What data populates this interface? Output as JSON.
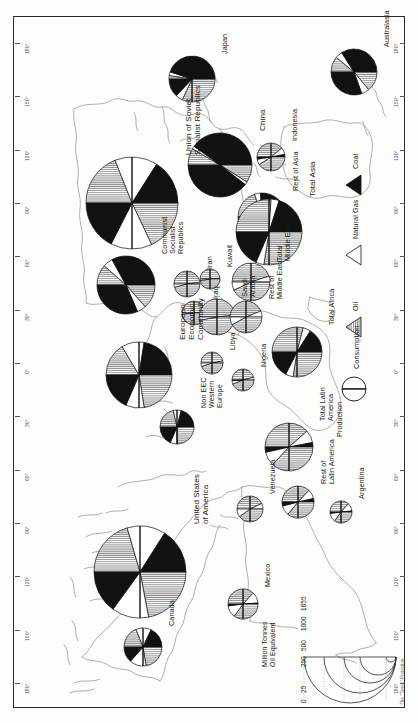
{
  "map": {
    "projection_credit": "The \"Times\" Projection",
    "scale_title": "Million Tonnes\nOil Equivalent",
    "scale_labels": [
      "1655",
      "1000",
      "500",
      "250",
      "25",
      "0"
    ],
    "longitude_ticks_left": [
      "180°",
      "150°",
      "120°",
      "90°",
      "60°",
      "30°",
      "0°",
      "30°",
      "60°",
      "90°",
      "120°",
      "150°",
      "180°"
    ],
    "longitude_ticks_right": [
      "180°",
      "150°",
      "120°",
      "90°",
      "60°",
      "30°",
      "0°",
      "30°",
      "60°",
      "90°",
      "120°",
      "150°",
      "180°"
    ],
    "latitude_ticks": [
      "60°",
      "30°",
      "0°",
      "30°",
      "60°"
    ]
  },
  "legend": {
    "production_label": "Production",
    "consumption_label": "Consumption",
    "fuels": [
      {
        "name": "Oil",
        "color": "#9a9a9a",
        "pattern": "vertical-stripe"
      },
      {
        "name": "Natural Gas",
        "color": "#ffffff",
        "pattern": "solid"
      },
      {
        "name": "Coal",
        "color": "#111111",
        "pattern": "solid"
      }
    ]
  },
  "chart_data": {
    "type": "pie",
    "units": "Million Tonnes Oil Equivalent",
    "series_names": [
      "Oil",
      "Natural Gas",
      "Coal"
    ],
    "colors": [
      "#9a9a9a",
      "#ffffff",
      "#111111"
    ],
    "halves": {
      "top": "Production",
      "bottom": "Consumption"
    },
    "regions": [
      {
        "name": "Union of Soviet\nSocialist Republics",
        "x": 118,
        "y": 186,
        "r": 46,
        "production": {
          "Oil": 38,
          "Natural Gas": 30,
          "Coal": 32
        },
        "consumption": {
          "Oil": 36,
          "Natural Gas": 29,
          "Coal": 35
        }
      },
      {
        "name": "China",
        "x": 206,
        "y": 148,
        "r": 32,
        "production": {
          "Oil": 17,
          "Natural Gas": 3,
          "Coal": 80
        },
        "consumption": {
          "Oil": 18,
          "Natural Gas": 3,
          "Coal": 79
        }
      },
      {
        "name": "Japan",
        "x": 178,
        "y": 62,
        "r": 23,
        "production": {
          "Oil": 5,
          "Natural Gas": 5,
          "Coal": 90
        },
        "consumption": {
          "Oil": 64,
          "Natural Gas": 10,
          "Coal": 26
        }
      },
      {
        "name": "Indonesia",
        "x": 257,
        "y": 140,
        "r": 14,
        "production": {
          "Oil": 78,
          "Natural Gas": 16,
          "Coal": 6
        },
        "consumption": {
          "Oil": 82,
          "Natural Gas": 13,
          "Coal": 5
        }
      },
      {
        "name": "Rest of Asia",
        "x": 248,
        "y": 200,
        "r": 24,
        "production": {
          "Oil": 40,
          "Natural Gas": 8,
          "Coal": 52
        },
        "consumption": {
          "Oil": 46,
          "Natural Gas": 9,
          "Coal": 45
        }
      },
      {
        "name": "Total Asia",
        "x": 255,
        "y": 215,
        "r": 33,
        "production": {
          "Oil": 52,
          "Natural Gas": 8,
          "Coal": 40
        },
        "consumption": {
          "Oil": 55,
          "Natural Gas": 8,
          "Coal": 37
        }
      },
      {
        "name": "Australasia",
        "x": 340,
        "y": 55,
        "r": 23,
        "production": {
          "Oil": 22,
          "Natural Gas": 10,
          "Coal": 68
        },
        "consumption": {
          "Oil": 28,
          "Natural Gas": 11,
          "Coal": 61
        }
      },
      {
        "name": "Communist\nSocialist\nRepublics",
        "x": 112,
        "y": 268,
        "r": 29,
        "production": {
          "Oil": 23,
          "Natural Gas": 11,
          "Coal": 66
        },
        "consumption": {
          "Oil": 27,
          "Natural Gas": 10,
          "Coal": 63
        }
      },
      {
        "name": "Iran",
        "x": 173,
        "y": 267,
        "r": 13,
        "production": {
          "Oil": 96,
          "Natural Gas": 4,
          "Coal": 0
        },
        "consumption": {
          "Oil": 92,
          "Natural Gas": 8,
          "Coal": 0
        }
      },
      {
        "name": "Kuwait",
        "x": 196,
        "y": 262,
        "r": 10,
        "production": {
          "Oil": 98,
          "Natural Gas": 2,
          "Coal": 0
        },
        "consumption": {
          "Oil": 95,
          "Natural Gas": 5,
          "Coal": 0
        }
      },
      {
        "name": "Iraq",
        "x": 180,
        "y": 296,
        "r": 12,
        "production": {
          "Oil": 99,
          "Natural Gas": 1,
          "Coal": 0
        },
        "consumption": {
          "Oil": 97,
          "Natural Gas": 3,
          "Coal": 0
        }
      },
      {
        "name": "Saudi\nArabia",
        "x": 203,
        "y": 300,
        "r": 18,
        "production": {
          "Oil": 97,
          "Natural Gas": 3,
          "Coal": 0
        },
        "consumption": {
          "Oil": 94,
          "Natural Gas": 6,
          "Coal": 0
        }
      },
      {
        "name": "Rest of\nMiddle East",
        "x": 232,
        "y": 300,
        "r": 16,
        "production": {
          "Oil": 88,
          "Natural Gas": 12,
          "Coal": 0
        },
        "consumption": {
          "Oil": 84,
          "Natural Gas": 16,
          "Coal": 0
        }
      },
      {
        "name": "Total\nMiddle East",
        "x": 237,
        "y": 265,
        "r": 19,
        "production": {
          "Oil": 90,
          "Natural Gas": 10,
          "Coal": 0
        },
        "consumption": {
          "Oil": 86,
          "Natural Gas": 14,
          "Coal": 0
        }
      },
      {
        "name": "European\nEconomic\nCommunity",
        "x": 125,
        "y": 358,
        "r": 33,
        "production": {
          "Oil": 33,
          "Natural Gas": 22,
          "Coal": 45
        },
        "consumption": {
          "Oil": 45,
          "Natural Gas": 18,
          "Coal": 37
        }
      },
      {
        "name": "Non EEC\nWestern\nEurope",
        "x": 163,
        "y": 410,
        "r": 17,
        "production": {
          "Oil": 43,
          "Natural Gas": 15,
          "Coal": 42
        },
        "consumption": {
          "Oil": 50,
          "Natural Gas": 13,
          "Coal": 37
        }
      },
      {
        "name": "Libya",
        "x": 198,
        "y": 346,
        "r": 11,
        "production": {
          "Oil": 94,
          "Natural Gas": 6,
          "Coal": 0
        },
        "consumption": {
          "Oil": 90,
          "Natural Gas": 10,
          "Coal": 0
        }
      },
      {
        "name": "Nigeria",
        "x": 229,
        "y": 363,
        "r": 11,
        "production": {
          "Oil": 92,
          "Natural Gas": 8,
          "Coal": 0
        },
        "consumption": {
          "Oil": 88,
          "Natural Gas": 10,
          "Coal": 2
        }
      },
      {
        "name": "Total Africa",
        "x": 283,
        "y": 335,
        "r": 25,
        "production": {
          "Oil": 58,
          "Natural Gas": 10,
          "Coal": 32
        },
        "consumption": {
          "Oil": 55,
          "Natural Gas": 10,
          "Coal": 35
        }
      },
      {
        "name": "Total Latin\nAmerica",
        "x": 275,
        "y": 430,
        "r": 24,
        "production": {
          "Oil": 77,
          "Natural Gas": 17,
          "Coal": 6
        },
        "consumption": {
          "Oil": 74,
          "Natural Gas": 19,
          "Coal": 7
        }
      },
      {
        "name": "Rest of\nLatin America",
        "x": 284,
        "y": 485,
        "r": 16,
        "production": {
          "Oil": 74,
          "Natural Gas": 19,
          "Coal": 7
        },
        "consumption": {
          "Oil": 72,
          "Natural Gas": 20,
          "Coal": 8
        }
      },
      {
        "name": "Venezuela",
        "x": 236,
        "y": 492,
        "r": 13,
        "production": {
          "Oil": 86,
          "Natural Gas": 14,
          "Coal": 0
        },
        "consumption": {
          "Oil": 80,
          "Natural Gas": 20,
          "Coal": 0
        }
      },
      {
        "name": "Argentina",
        "x": 327,
        "y": 495,
        "r": 11,
        "production": {
          "Oil": 73,
          "Natural Gas": 24,
          "Coal": 3
        },
        "consumption": {
          "Oil": 70,
          "Natural Gas": 26,
          "Coal": 4
        }
      },
      {
        "name": "Mexico",
        "x": 229,
        "y": 587,
        "r": 15,
        "production": {
          "Oil": 74,
          "Natural Gas": 24,
          "Coal": 2
        },
        "consumption": {
          "Oil": 70,
          "Natural Gas": 26,
          "Coal": 4
        }
      },
      {
        "name": "United States\nof America",
        "x": 126,
        "y": 555,
        "r": 46,
        "production": {
          "Oil": 41,
          "Natural Gas": 27,
          "Coal": 32
        },
        "consumption": {
          "Oil": 44,
          "Natural Gas": 26,
          "Coal": 30
        }
      },
      {
        "name": "Canada",
        "x": 129,
        "y": 630,
        "r": 19,
        "production": {
          "Oil": 38,
          "Natural Gas": 26,
          "Coal": 36
        },
        "consumption": {
          "Oil": 45,
          "Natural Gas": 28,
          "Coal": 27
        }
      }
    ]
  }
}
